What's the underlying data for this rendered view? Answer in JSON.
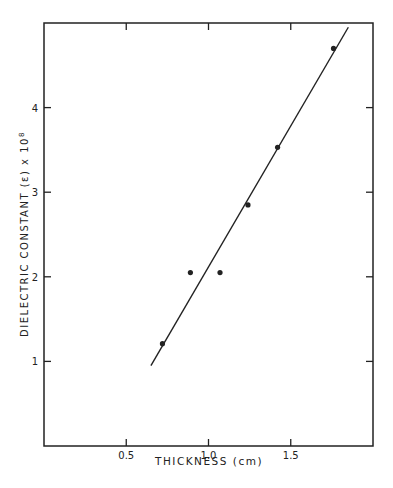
{
  "chart_data": {
    "type": "scatter",
    "title": "",
    "xlabel": "THICKNESS (cm)",
    "ylabel": "DIELECTRIC CONSTANT (ε) x 10",
    "ylabel_exponent": "8",
    "xlim": [
      0,
      2.0
    ],
    "ylim": [
      0,
      5.0
    ],
    "x_ticks": [
      0.5,
      1.0,
      1.5
    ],
    "x_tick_labels": [
      "0.5",
      "1.0",
      "1.5"
    ],
    "y_ticks": [
      1,
      2,
      3,
      4
    ],
    "y_tick_labels": [
      "1",
      "2",
      "3",
      "4"
    ],
    "grid": false,
    "legend": null,
    "series": [
      {
        "name": "measured",
        "kind": "points",
        "x": [
          0.72,
          0.89,
          1.07,
          1.24,
          1.42,
          1.76
        ],
        "y": [
          1.21,
          2.05,
          2.05,
          2.85,
          3.53,
          4.7
        ]
      },
      {
        "name": "fit",
        "kind": "line",
        "x": [
          0.65,
          1.85
        ],
        "y": [
          0.95,
          4.95
        ]
      }
    ]
  },
  "colors": {
    "ink": "#222222",
    "background": "#ffffff"
  }
}
